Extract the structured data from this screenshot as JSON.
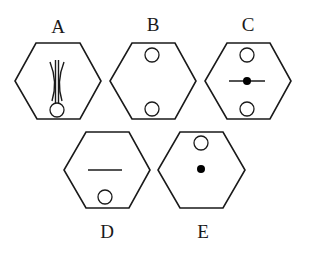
{
  "figure": {
    "type": "visual-reasoning-options",
    "options": [
      {
        "label": "A",
        "elements": [
          "open-circle-bottom",
          "crossing-curved-lines-vertical-center"
        ]
      },
      {
        "label": "B",
        "elements": [
          "open-circle-top",
          "open-circle-bottom"
        ]
      },
      {
        "label": "C",
        "elements": [
          "open-circle-top",
          "open-circle-bottom",
          "filled-dot-center",
          "horizontal-line-center"
        ]
      },
      {
        "label": "D",
        "elements": [
          "horizontal-line-center",
          "open-circle-bottom"
        ]
      },
      {
        "label": "E",
        "elements": [
          "open-circle-top",
          "filled-dot-center"
        ]
      }
    ],
    "colors": {
      "stroke": "#1a1a1a",
      "fill_dot": "#000000",
      "background": "#ffffff"
    }
  }
}
